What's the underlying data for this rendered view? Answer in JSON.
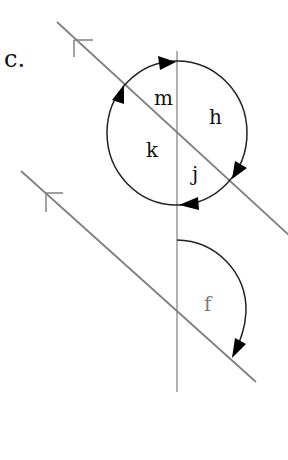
{
  "figure": {
    "part_label": "c.",
    "angle_labels": {
      "m": "m",
      "h": "h",
      "k": "k",
      "j": "j",
      "f": "f"
    },
    "colors": {
      "background": "#ffffff",
      "transversal": "#888888",
      "parallel_lines": "#808080",
      "arcs": "#222222",
      "arrowheads": "#000000",
      "text": "#111111",
      "label_f": "#7a7a7a"
    },
    "elements": {
      "transversal": "vertical line",
      "parallel_line_upper": "line with parallel marker (arrow tick)",
      "parallel_line_lower": "line with parallel marker (arrow tick)",
      "full_circle_arc": "four angles m, h, j, k around upper intersection",
      "quarter_arc": "angle f at lower intersection"
    }
  }
}
